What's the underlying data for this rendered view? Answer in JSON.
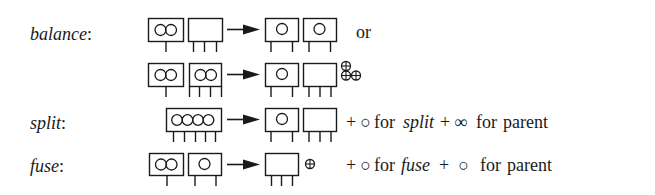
{
  "rows": [
    {
      "id": "balance",
      "label": "balance",
      "colon": ":",
      "variants": [
        {
          "before": [
            {
              "keys": 2,
              "legs": 1
            },
            {
              "keys": 0,
              "legs": 3
            }
          ],
          "after": [
            {
              "keys": 1,
              "legs": 2
            },
            {
              "keys": 1,
              "legs": 2
            }
          ],
          "suffix": "or"
        },
        {
          "before": [
            {
              "keys": 2,
              "legs": 1
            },
            {
              "keys": 2,
              "legs": 4
            }
          ],
          "after": [
            {
              "keys": 1,
              "legs": 2
            },
            {
              "keys": 0,
              "legs": 3
            }
          ],
          "freed_nodes": 3
        }
      ]
    },
    {
      "id": "split",
      "label": "split",
      "colon": ":",
      "before": [
        {
          "keys": 4,
          "legs": 5
        }
      ],
      "after": [
        {
          "keys": 1,
          "legs": 2
        },
        {
          "keys": 0,
          "legs": 3
        }
      ],
      "cost": {
        "plus1": "+",
        "item1": "○",
        "for1": "for",
        "op": "split",
        "plus2": "+",
        "item2": "∞",
        "for2": "for",
        "target": "parent"
      }
    },
    {
      "id": "fuse",
      "label": "fuse",
      "colon": ":",
      "before": [
        {
          "keys": 2,
          "legs": 1
        },
        {
          "keys": 1,
          "legs": 2
        }
      ],
      "after": [
        {
          "keys": 0,
          "legs": 3
        }
      ],
      "freed_nodes": 1,
      "cost": {
        "plus1": "+",
        "item1": "○",
        "for1": "for",
        "op": "fuse",
        "plus2": "+",
        "item2": "○",
        "for2": "for",
        "target": "parent"
      }
    }
  ],
  "symbols": {
    "freed_node": "⊕",
    "arrow": "→"
  }
}
